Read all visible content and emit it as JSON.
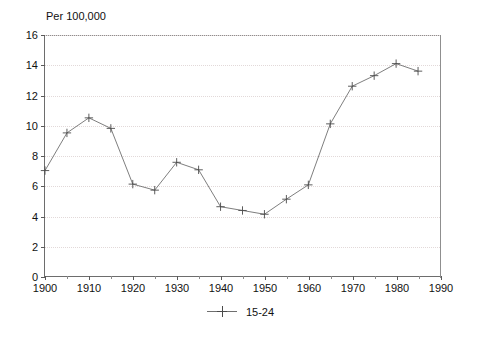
{
  "chart_data": {
    "type": "line",
    "title": "",
    "subtitle": "",
    "unit_label": "Per 100,000",
    "xlabel": "",
    "ylabel": "",
    "xlim": [
      1900,
      1990
    ],
    "ylim": [
      0,
      16
    ],
    "xticks": [
      1900,
      1910,
      1920,
      1930,
      1940,
      1950,
      1960,
      1970,
      1980,
      1990
    ],
    "xtick_labels": [
      "1900",
      "1910",
      "1920",
      "1930",
      "1940",
      "1950",
      "1960",
      "1970",
      "1980",
      "1990"
    ],
    "xtick_minor": [
      1905,
      1915,
      1925,
      1935,
      1945,
      1955,
      1965,
      1975,
      1985
    ],
    "yticks": [
      0,
      2,
      4,
      6,
      8,
      10,
      12,
      14,
      16
    ],
    "ytick_labels": [
      "0",
      "2",
      "4",
      "6",
      "8",
      "10",
      "12",
      "14",
      "16"
    ],
    "grid": true,
    "grid_style": "dotted-horizontal",
    "legend_position": "bottom-center",
    "marker": "plus",
    "line_color": "#6f6f6f",
    "marker_color": "#4a4a4a",
    "x": [
      1900,
      1905,
      1910,
      1915,
      1920,
      1925,
      1930,
      1935,
      1940,
      1945,
      1950,
      1955,
      1960,
      1965,
      1970,
      1975,
      1980,
      1985
    ],
    "series": [
      {
        "name": "15-24",
        "values": [
          7.0,
          9.5,
          10.5,
          9.8,
          6.1,
          5.7,
          7.55,
          7.05,
          4.6,
          4.35,
          4.1,
          5.1,
          6.05,
          10.1,
          12.6,
          13.3,
          14.1,
          13.6
        ]
      }
    ],
    "legend": [
      {
        "label": "15-24"
      }
    ]
  }
}
